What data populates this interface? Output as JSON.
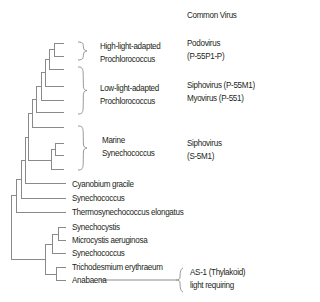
{
  "figure": {
    "column_header": "Common Virus",
    "colors": {
      "line": "#8a8a8a",
      "text": "#231f20",
      "background": "#ffffff"
    },
    "taxa_leaves": [
      {
        "label": "Cyanobium gracile",
        "x": 72,
        "y": 184
      },
      {
        "label": "Synechococcus",
        "x": 72,
        "y": 198
      },
      {
        "label": "Thermosynechococcus elongatus",
        "x": 72,
        "y": 212
      },
      {
        "label": "Synechocystis",
        "x": 72,
        "y": 227
      },
      {
        "label": "Microcystis aeruginosa",
        "x": 72,
        "y": 240
      },
      {
        "label": "Synechococcus",
        "x": 72,
        "y": 253
      },
      {
        "label": "Trichodesmium erythraeum",
        "x": 72,
        "y": 267
      },
      {
        "label": "Anabaena",
        "x": 72,
        "y": 280
      }
    ],
    "groups": [
      {
        "line1": "High-light-adapted",
        "line2": "Prochlorococcus",
        "x": 100,
        "y": 40,
        "virus": {
          "line1": "Podovirus",
          "line2": "(P-55P1-P)",
          "x": 187,
          "y": 37
        },
        "bracket": {
          "x": 78,
          "y1": 42,
          "y2": 60,
          "tip": 87
        }
      },
      {
        "line1": "Low-light-adapted",
        "line2": "Prochlorococcus",
        "x": 100,
        "y": 82,
        "virus": {
          "line1": "Siphovirus (P-55M1)",
          "line2": "Myovirus (P-551)",
          "x": 187,
          "y": 79
        },
        "bracket": {
          "x": 78,
          "y1": 67,
          "y2": 114,
          "tip": 87
        }
      },
      {
        "line1": "Marine",
        "line2": "Synechococcus",
        "x": 102,
        "y": 134,
        "virus": {
          "line1": "Siphovirus",
          "line2": "(S-5M1)",
          "x": 187,
          "y": 137
        },
        "bracket": {
          "x": 78,
          "y1": 126,
          "y2": 170,
          "tip": 87
        }
      }
    ],
    "annotation": {
      "line1": "AS-1 (Thylakoid)",
      "line2": "light requiring",
      "x": 190,
      "y": 266,
      "connector": {
        "x1": 100,
        "x2": 176,
        "y": 280
      },
      "bracket": {
        "x": 178,
        "y1": 268,
        "y2": 292,
        "tip": 174
      }
    },
    "tree_segments": [
      [
        54,
        43,
        64,
        43
      ],
      [
        54,
        56,
        64,
        56
      ],
      [
        54,
        43,
        54,
        56
      ],
      [
        49,
        49,
        54,
        49
      ],
      [
        49,
        69,
        64,
        69
      ],
      [
        49,
        49,
        49,
        69
      ],
      [
        45,
        59,
        49,
        59
      ],
      [
        45,
        86,
        64,
        86
      ],
      [
        45,
        59,
        45,
        86
      ],
      [
        41,
        72,
        45,
        72
      ],
      [
        41,
        100,
        64,
        100
      ],
      [
        41,
        72,
        41,
        100
      ],
      [
        36,
        86,
        41,
        86
      ],
      [
        36,
        112,
        64,
        112
      ],
      [
        36,
        86,
        36,
        112
      ],
      [
        32,
        99,
        36,
        99
      ],
      [
        32,
        127,
        64,
        127
      ],
      [
        32,
        99,
        32,
        127
      ],
      [
        55,
        143,
        64,
        143
      ],
      [
        55,
        155,
        64,
        155
      ],
      [
        55,
        143,
        55,
        155
      ],
      [
        51,
        149,
        55,
        149
      ],
      [
        51,
        169,
        64,
        169
      ],
      [
        51,
        149,
        51,
        169
      ],
      [
        28,
        113,
        32,
        113
      ],
      [
        28,
        160,
        51,
        160
      ],
      [
        28,
        113,
        28,
        160
      ],
      [
        25,
        137,
        28,
        137
      ],
      [
        25,
        183,
        66,
        183
      ],
      [
        25,
        137,
        25,
        183
      ],
      [
        21,
        160,
        25,
        160
      ],
      [
        21,
        198,
        66,
        198
      ],
      [
        21,
        160,
        21,
        198
      ],
      [
        16,
        179,
        21,
        179
      ],
      [
        16,
        212,
        66,
        212
      ],
      [
        16,
        179,
        16,
        212
      ],
      [
        58,
        227,
        66,
        227
      ],
      [
        58,
        240,
        66,
        240
      ],
      [
        58,
        227,
        58,
        240
      ],
      [
        52,
        234,
        58,
        234
      ],
      [
        52,
        253,
        66,
        253
      ],
      [
        52,
        234,
        52,
        253
      ],
      [
        56,
        267,
        66,
        267
      ],
      [
        56,
        280,
        66,
        280
      ],
      [
        56,
        267,
        56,
        280
      ],
      [
        45,
        244,
        52,
        244
      ],
      [
        45,
        274,
        56,
        274
      ],
      [
        45,
        244,
        45,
        274
      ],
      [
        11,
        195,
        16,
        195
      ],
      [
        11,
        259,
        45,
        259
      ],
      [
        11,
        195,
        11,
        259
      ]
    ]
  }
}
